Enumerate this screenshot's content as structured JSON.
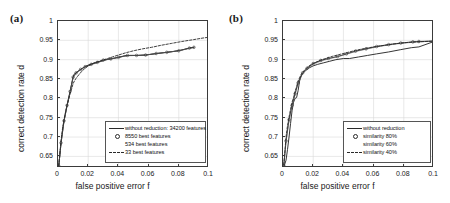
{
  "figure": {
    "panels": [
      {
        "label": "(a)",
        "xlabel": "false positive error f",
        "ylabel": "correct detection rate d",
        "xticks": [
          "0",
          "0.02",
          "0.04",
          "0.06",
          "0.08",
          "0.1"
        ],
        "yticks": [
          "0.65",
          "0.7",
          "0.75",
          "0.8",
          "0.85",
          "0.9",
          "0.95",
          "1"
        ],
        "legend": [
          {
            "label": "without reduction: 34200 features",
            "key": "solid"
          },
          {
            "label": "8550 best features",
            "key": "circle"
          },
          {
            "label": "534 best features",
            "key": "none"
          },
          {
            "label": "33 best features",
            "key": "dashed"
          }
        ]
      },
      {
        "label": "(b)",
        "xlabel": "false positive error f",
        "ylabel": "correct detection rate d",
        "xticks": [
          "0",
          "0.02",
          "0.04",
          "0.06",
          "0.08",
          "0.1"
        ],
        "yticks": [
          "0.65",
          "0.7",
          "0.75",
          "0.8",
          "0.85",
          "0.9",
          "0.95",
          "1"
        ],
        "legend": [
          {
            "label": "without reduction",
            "key": "solid"
          },
          {
            "label": "similarity 80%",
            "key": "circle"
          },
          {
            "label": "similarity 60%",
            "key": "none"
          },
          {
            "label": "similarity 40%",
            "key": "dashed"
          }
        ]
      }
    ]
  },
  "chart_data": [
    {
      "type": "line",
      "title": "(a)",
      "xlabel": "false positive error f",
      "ylabel": "correct detection rate d",
      "xlim": [
        0,
        0.1
      ],
      "ylim": [
        0.62,
        1
      ],
      "grid": true,
      "legend_position": "lower right",
      "series": [
        {
          "name": "without reduction: 34200 features",
          "style": "solid",
          "x": [
            0.0005,
            0.001,
            0.0015,
            0.002,
            0.0025,
            0.003,
            0.0035,
            0.004,
            0.0045,
            0.005,
            0.0055,
            0.006,
            0.0065,
            0.007,
            0.0075,
            0.008,
            0.009,
            0.01,
            0.0105,
            0.011,
            0.012,
            0.013,
            0.014,
            0.016,
            0.018,
            0.02,
            0.023,
            0.026,
            0.029,
            0.032,
            0.036,
            0.04,
            0.044,
            0.048,
            0.053,
            0.058,
            0.064,
            0.07,
            0.076,
            0.082,
            0.087,
            0.09
          ],
          "y": [
            0.625,
            0.645,
            0.665,
            0.685,
            0.7,
            0.715,
            0.73,
            0.742,
            0.752,
            0.762,
            0.772,
            0.782,
            0.79,
            0.8,
            0.808,
            0.818,
            0.836,
            0.855,
            0.861,
            0.864,
            0.866,
            0.869,
            0.872,
            0.877,
            0.882,
            0.886,
            0.89,
            0.893,
            0.896,
            0.9,
            0.903,
            0.906,
            0.91,
            0.911,
            0.911,
            0.912,
            0.915,
            0.918,
            0.921,
            0.925,
            0.93,
            0.932
          ]
        },
        {
          "name": "8550 best features",
          "style": "solid-with-circle-markers",
          "x": [
            0.0005,
            0.002,
            0.004,
            0.006,
            0.008,
            0.01,
            0.012,
            0.015,
            0.018,
            0.022,
            0.026,
            0.03,
            0.035,
            0.04,
            0.046,
            0.052,
            0.058,
            0.065,
            0.072,
            0.08,
            0.087,
            0.09
          ],
          "y": [
            0.625,
            0.685,
            0.742,
            0.782,
            0.818,
            0.855,
            0.866,
            0.875,
            0.882,
            0.888,
            0.893,
            0.899,
            0.902,
            0.906,
            0.911,
            0.911,
            0.912,
            0.916,
            0.919,
            0.923,
            0.93,
            0.932
          ]
        },
        {
          "name": "534 best features",
          "style": "thin-solid",
          "x": [
            0.0005,
            0.002,
            0.004,
            0.006,
            0.008,
            0.01,
            0.012,
            0.015,
            0.018,
            0.022,
            0.026,
            0.03,
            0.035,
            0.04,
            0.046,
            0.052,
            0.058,
            0.065,
            0.072,
            0.08,
            0.087,
            0.09
          ],
          "y": [
            0.625,
            0.683,
            0.74,
            0.78,
            0.816,
            0.853,
            0.864,
            0.874,
            0.881,
            0.887,
            0.892,
            0.898,
            0.902,
            0.906,
            0.91,
            0.911,
            0.912,
            0.916,
            0.919,
            0.923,
            0.929,
            0.931
          ]
        },
        {
          "name": "33 best features",
          "style": "dashed",
          "x": [
            0.0005,
            0.001,
            0.002,
            0.003,
            0.004,
            0.005,
            0.006,
            0.007,
            0.008,
            0.009,
            0.01,
            0.011,
            0.012,
            0.014,
            0.016,
            0.018,
            0.02,
            0.024,
            0.028,
            0.032,
            0.036,
            0.04,
            0.045,
            0.05,
            0.056,
            0.062,
            0.068,
            0.075,
            0.082,
            0.09,
            0.096,
            0.1
          ],
          "y": [
            0.626,
            0.648,
            0.69,
            0.722,
            0.745,
            0.765,
            0.782,
            0.796,
            0.812,
            0.824,
            0.838,
            0.846,
            0.852,
            0.862,
            0.871,
            0.878,
            0.884,
            0.892,
            0.897,
            0.902,
            0.907,
            0.912,
            0.918,
            0.923,
            0.928,
            0.932,
            0.937,
            0.942,
            0.947,
            0.952,
            0.956,
            0.958
          ]
        }
      ]
    },
    {
      "type": "line",
      "title": "(b)",
      "xlabel": "false positive error f",
      "ylabel": "correct detection rate d",
      "xlim": [
        0,
        0.1
      ],
      "ylim": [
        0.62,
        1
      ],
      "grid": true,
      "legend_position": "lower right",
      "series": [
        {
          "name": "without reduction",
          "style": "solid",
          "x": [
            0.0005,
            0.002,
            0.003,
            0.004,
            0.005,
            0.006,
            0.007,
            0.008,
            0.009,
            0.01,
            0.011,
            0.012,
            0.013,
            0.015,
            0.017,
            0.02,
            0.023,
            0.027,
            0.031,
            0.035,
            0.04,
            0.044,
            0.05,
            0.056,
            0.062,
            0.07,
            0.078,
            0.085,
            0.09,
            0.1
          ],
          "y": [
            0.622,
            0.64,
            0.668,
            0.7,
            0.735,
            0.768,
            0.79,
            0.8,
            0.802,
            0.82,
            0.845,
            0.858,
            0.864,
            0.872,
            0.878,
            0.884,
            0.888,
            0.892,
            0.896,
            0.9,
            0.903,
            0.903,
            0.907,
            0.911,
            0.915,
            0.92,
            0.926,
            0.931,
            0.933,
            0.947
          ]
        },
        {
          "name": "similarity 80%",
          "style": "solid-with-circle-markers",
          "x": [
            0.0005,
            0.002,
            0.004,
            0.006,
            0.008,
            0.01,
            0.013,
            0.016,
            0.02,
            0.025,
            0.03,
            0.036,
            0.042,
            0.048,
            0.055,
            0.062,
            0.07,
            0.078,
            0.086,
            0.09,
            0.1
          ],
          "y": [
            0.626,
            0.69,
            0.745,
            0.782,
            0.812,
            0.84,
            0.866,
            0.878,
            0.89,
            0.898,
            0.903,
            0.908,
            0.915,
            0.922,
            0.928,
            0.934,
            0.939,
            0.943,
            0.946,
            0.947,
            0.948
          ]
        },
        {
          "name": "similarity 60%",
          "style": "thin-solid",
          "x": [
            0.0005,
            0.002,
            0.004,
            0.006,
            0.008,
            0.01,
            0.013,
            0.016,
            0.02,
            0.025,
            0.03,
            0.036,
            0.042,
            0.048,
            0.055,
            0.062,
            0.07,
            0.078,
            0.086,
            0.09,
            0.1
          ],
          "y": [
            0.624,
            0.688,
            0.742,
            0.78,
            0.81,
            0.838,
            0.864,
            0.876,
            0.888,
            0.896,
            0.902,
            0.907,
            0.914,
            0.921,
            0.927,
            0.933,
            0.938,
            0.942,
            0.945,
            0.946,
            0.948
          ]
        },
        {
          "name": "similarity 40%",
          "style": "dashed",
          "x": [
            0.0005,
            0.001,
            0.002,
            0.003,
            0.004,
            0.005,
            0.006,
            0.007,
            0.008,
            0.009,
            0.01,
            0.012,
            0.014,
            0.016,
            0.018,
            0.021,
            0.025,
            0.029,
            0.033,
            0.038,
            0.043,
            0.048,
            0.054,
            0.06,
            0.067,
            0.074,
            0.081,
            0.088,
            0.094,
            0.1
          ],
          "y": [
            0.628,
            0.65,
            0.7,
            0.73,
            0.752,
            0.772,
            0.79,
            0.802,
            0.818,
            0.83,
            0.845,
            0.862,
            0.872,
            0.88,
            0.886,
            0.892,
            0.899,
            0.904,
            0.909,
            0.914,
            0.919,
            0.924,
            0.929,
            0.933,
            0.937,
            0.941,
            0.944,
            0.946,
            0.947,
            0.948
          ]
        }
      ]
    }
  ]
}
